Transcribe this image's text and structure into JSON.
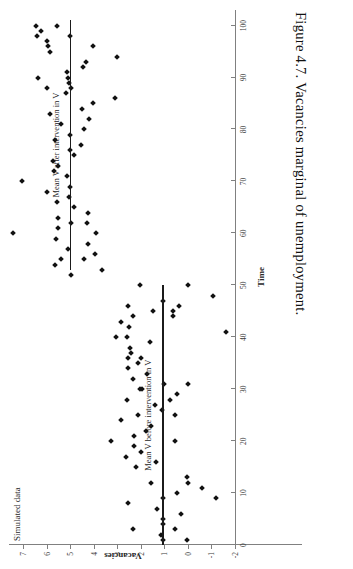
{
  "caption": {
    "text": "Figure 4.7.  Vacancies marginal of unemployment."
  },
  "chart_data": {
    "type": "scatter",
    "title": "Simulated data",
    "xlabel": "Time",
    "ylabel": "Vacancies",
    "xlim": [
      0,
      103
    ],
    "ylim": [
      -2,
      7.6
    ],
    "xticks": [
      0,
      10,
      20,
      30,
      40,
      50,
      60,
      70,
      80,
      90,
      100
    ],
    "xticklabels": [
      "0",
      "10",
      "20",
      "30",
      "40",
      "50",
      "60",
      "70",
      "80",
      "90",
      "100"
    ],
    "yticks": [
      -2,
      -1,
      0,
      1,
      2,
      3,
      4,
      5,
      6,
      7
    ],
    "yticklabels": [
      "-2",
      "-1",
      "0",
      "1",
      "2",
      "3",
      "4",
      "5",
      "6",
      "7"
    ],
    "grid": false,
    "legend": "none",
    "marker": "diamond",
    "marker_color": "#111111",
    "axis_color": "#808080",
    "annotations": [
      {
        "name": "mean-before",
        "label": "Mean V before intervention in V",
        "value": 1.05,
        "x_start": 0,
        "x_end": 50,
        "color": "#1b1b1b"
      },
      {
        "name": "mean-after",
        "label": "Mean V after intervention in V",
        "value": 4.98,
        "x_start": 53,
        "x_end": 101,
        "color": "#1b1b1b"
      }
    ],
    "series": [
      {
        "name": "Vacancies before intervention",
        "points": [
          [
            1,
            0.05
          ],
          [
            1,
            1.05
          ],
          [
            2,
            1.15
          ],
          [
            3,
            0.55
          ],
          [
            3,
            2.35
          ],
          [
            4,
            1.05
          ],
          [
            5,
            1.05
          ],
          [
            6,
            0.3
          ],
          [
            7,
            1.3
          ],
          [
            8,
            2.55
          ],
          [
            9,
            1.05
          ],
          [
            9,
            -1.2
          ],
          [
            10,
            0.45
          ],
          [
            11,
            -0.6
          ],
          [
            12,
            1.55
          ],
          [
            12,
            0.0
          ],
          [
            13,
            0.05
          ],
          [
            15,
            2.2
          ],
          [
            16,
            1.35
          ],
          [
            17,
            2.65
          ],
          [
            18,
            2.0
          ],
          [
            19,
            2.3
          ],
          [
            20,
            0.55
          ],
          [
            20,
            3.25
          ],
          [
            21,
            2.3
          ],
          [
            22,
            1.8
          ],
          [
            23,
            1.55
          ],
          [
            24,
            2.85
          ],
          [
            25,
            0.55
          ],
          [
            25,
            2.1
          ],
          [
            26,
            1.1
          ],
          [
            27,
            1.4
          ],
          [
            28,
            2.6
          ],
          [
            28,
            0.75
          ],
          [
            29,
            0.45
          ],
          [
            30,
            1.95
          ],
          [
            30,
            2.05
          ],
          [
            31,
            1.0
          ],
          [
            31,
            0.0
          ],
          [
            32,
            2.35
          ],
          [
            33,
            1.75
          ],
          [
            34,
            2.55
          ],
          [
            35,
            2.1
          ],
          [
            36,
            2.55
          ],
          [
            36,
            2.0
          ],
          [
            37,
            2.4
          ],
          [
            38,
            2.45
          ],
          [
            39,
            1.6
          ],
          [
            40,
            2.6
          ],
          [
            40,
            3.05
          ],
          [
            41,
            -1.6
          ],
          [
            42,
            2.5
          ],
          [
            43,
            2.85
          ],
          [
            44,
            2.35
          ],
          [
            44,
            0.65
          ],
          [
            45,
            0.65
          ],
          [
            45,
            1.5
          ],
          [
            46,
            0.4
          ],
          [
            46,
            2.55
          ],
          [
            47,
            1.05
          ],
          [
            48,
            -1.05
          ],
          [
            50,
            0.0
          ],
          [
            50,
            2.05
          ]
        ]
      },
      {
        "name": "Vacancies after intervention",
        "points": [
          [
            52,
            4.95
          ],
          [
            53,
            3.65
          ],
          [
            54,
            5.65
          ],
          [
            55,
            4.4
          ],
          [
            55,
            5.4
          ],
          [
            56,
            3.95
          ],
          [
            57,
            5.1
          ],
          [
            58,
            4.25
          ],
          [
            59,
            5.6
          ],
          [
            60,
            7.45
          ],
          [
            60,
            3.9
          ],
          [
            61,
            5.5
          ],
          [
            62,
            4.95
          ],
          [
            62,
            4.3
          ],
          [
            63,
            5.5
          ],
          [
            64,
            4.25
          ],
          [
            65,
            4.85
          ],
          [
            66,
            5.55
          ],
          [
            67,
            5.05
          ],
          [
            68,
            6.0
          ],
          [
            69,
            5.0
          ],
          [
            70,
            7.05
          ],
          [
            71,
            5.15
          ],
          [
            72,
            5.7
          ],
          [
            73,
            5.5
          ],
          [
            74,
            5.75
          ],
          [
            75,
            4.85
          ],
          [
            76,
            5.0
          ],
          [
            77,
            4.55
          ],
          [
            78,
            5.65
          ],
          [
            79,
            5.0
          ],
          [
            80,
            4.4
          ],
          [
            81,
            5.4
          ],
          [
            82,
            4.2
          ],
          [
            83,
            5.85
          ],
          [
            84,
            4.5
          ],
          [
            85,
            4.05
          ],
          [
            86,
            3.1
          ],
          [
            87,
            5.2
          ],
          [
            88,
            4.95
          ],
          [
            88,
            6.0
          ],
          [
            89,
            5.05
          ],
          [
            90,
            5.1
          ],
          [
            90,
            6.35
          ],
          [
            91,
            5.15
          ],
          [
            92,
            4.45
          ],
          [
            93,
            4.35
          ],
          [
            94,
            3.0
          ],
          [
            95,
            5.85
          ],
          [
            96,
            4.05
          ],
          [
            96,
            5.95
          ],
          [
            97,
            6.0
          ],
          [
            98,
            6.4
          ],
          [
            98,
            5.0
          ],
          [
            99,
            6.25
          ],
          [
            100,
            6.45
          ],
          [
            100,
            5.55
          ]
        ]
      }
    ]
  }
}
